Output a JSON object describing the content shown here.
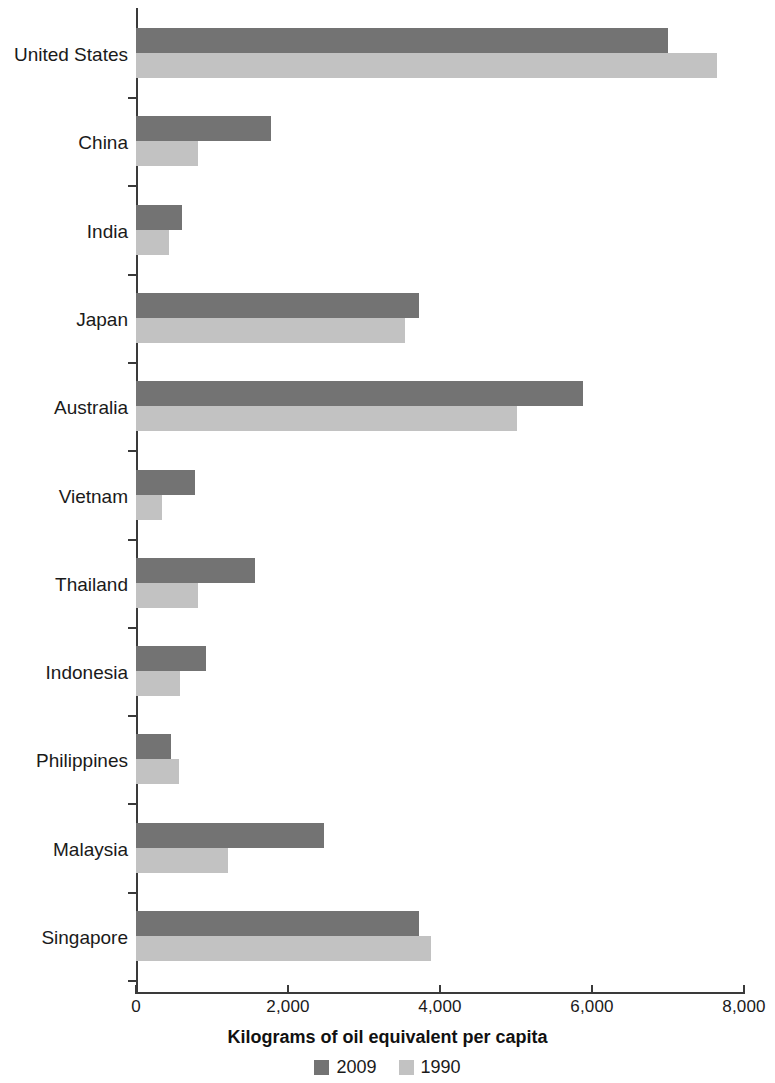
{
  "chart_data": {
    "type": "bar",
    "orientation": "horizontal",
    "title": "",
    "xlabel": "Kilograms of oil equivalent per capita",
    "ylabel": "",
    "xlim": [
      0,
      8000
    ],
    "xticks": [
      0,
      2000,
      4000,
      6000,
      8000
    ],
    "xtick_labels": [
      "0",
      "2,000",
      "4,000",
      "6,000",
      "8,000"
    ],
    "grid": false,
    "legend_position": "bottom-center",
    "categories": [
      "United States",
      "China",
      "India",
      "Japan",
      "Australia",
      "Vietnam",
      "Thailand",
      "Indonesia",
      "Philippines",
      "Malaysia",
      "Singapore"
    ],
    "series": [
      {
        "name": "2009",
        "color": "#737373",
        "values": [
          7000,
          1775,
          610,
          3720,
          5875,
          775,
          1560,
          920,
          460,
          2470,
          3720
        ]
      },
      {
        "name": "1990",
        "color": "#c2c2c2",
        "values": [
          7650,
          815,
          430,
          3540,
          5010,
          340,
          810,
          580,
          565,
          1210,
          3880
        ]
      }
    ]
  },
  "axis": {
    "line_color": "#3a3a3a"
  }
}
